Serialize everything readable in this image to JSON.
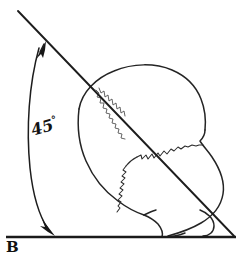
{
  "figure": {
    "kind": "hand-drawn anatomical diagram",
    "background_color": "#ffffff",
    "ink_color": "#161616",
    "width": 241,
    "height": 264
  },
  "labels": {
    "baseline_label": "B",
    "angle_value": "45",
    "angle_unit": "°",
    "angle_text": "45°"
  },
  "annotations": {
    "baseline_name": "baseline-b",
    "oblique_line_name": "oblique-reference-line",
    "angle_arc_name": "angle-arc-45-degrees",
    "arrow_top_name": "arrow-head-upper",
    "arrow_bottom_name": "arrow-head-lower",
    "suture_sagittal_name": "sagittal-suture",
    "suture_coronal_name": "coronal-suture",
    "skull_name": "skull-outline"
  },
  "geometry": {
    "baseline_y": 237,
    "baseline_x_start": 6,
    "baseline_x_end": 236,
    "oblique_start": [
      18,
      11
    ],
    "oblique_end": [
      234,
      236
    ],
    "angle_degrees": 45,
    "arc_top": [
      38,
      45
    ],
    "arc_bottom": [
      50,
      230
    ]
  }
}
